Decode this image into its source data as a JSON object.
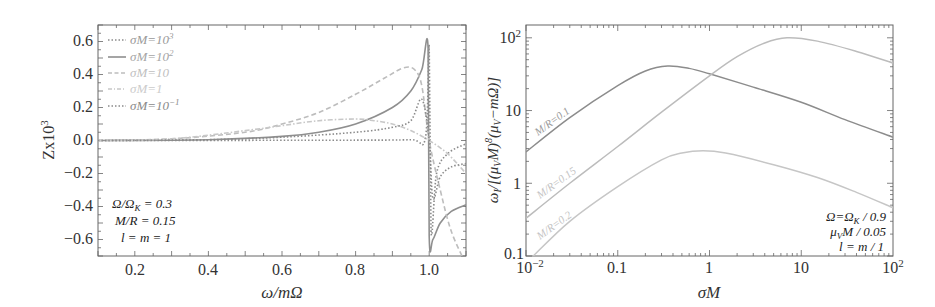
{
  "chart_data": [
    {
      "type": "line",
      "title": "",
      "xlabel": "ω/mΩ",
      "ylabel": "Zx10³",
      "xlim": [
        0.1,
        1.1
      ],
      "ylim": [
        -0.7,
        0.7
      ],
      "xticks": [
        "0.2",
        "0.4",
        "0.6",
        "0.8",
        "1.0"
      ],
      "yticks": [
        "0.6",
        "0.4",
        "0.2",
        "0.0",
        "-0.2",
        "-0.4",
        "-0.6"
      ],
      "grid": false,
      "legend_position": "upper-left",
      "legend": [
        "σM=10³",
        "σM=10²",
        "σM=10",
        "σM=1",
        "σM=10⁻¹"
      ],
      "annotations": [
        "Ω/Ω_K = 0.3",
        "M/R = 0.15",
        "l = m = 1"
      ],
      "series": [
        {
          "name": "σM=10³",
          "style": "dotted",
          "color": "#8a8a8a",
          "x": [
            0.1,
            0.5,
            0.8,
            0.95,
            0.99,
            1.0,
            1.005,
            1.02,
            1.05,
            1.1
          ],
          "y": [
            0.0,
            0.001,
            0.002,
            0.005,
            0.02,
            0.57,
            -0.55,
            -0.2,
            -0.08,
            -0.02
          ]
        },
        {
          "name": "σM=10²",
          "style": "solid",
          "color": "#8f8f8f",
          "x": [
            0.1,
            0.4,
            0.6,
            0.7,
            0.8,
            0.9,
            0.95,
            0.98,
            0.997,
            1.0,
            1.01,
            1.03,
            1.06,
            1.1
          ],
          "y": [
            0.0,
            0.005,
            0.025,
            0.05,
            0.1,
            0.2,
            0.3,
            0.43,
            0.56,
            -0.58,
            -0.6,
            -0.5,
            -0.43,
            -0.39
          ]
        },
        {
          "name": "σM=10",
          "style": "dashed",
          "color": "#bdbdbd",
          "x": [
            0.1,
            0.3,
            0.5,
            0.6,
            0.7,
            0.8,
            0.88,
            0.93,
            0.96,
            0.98,
            1.0,
            1.03,
            1.06,
            1.1
          ],
          "y": [
            0.0,
            0.01,
            0.05,
            0.1,
            0.17,
            0.28,
            0.38,
            0.44,
            0.43,
            0.33,
            0.0,
            -0.3,
            -0.55,
            -0.75
          ]
        },
        {
          "name": "σM=1",
          "style": "dash-dot",
          "color": "#c8c8c8",
          "x": [
            0.1,
            0.3,
            0.5,
            0.6,
            0.7,
            0.8,
            0.85,
            0.9,
            0.95,
            1.0,
            1.05,
            1.1
          ],
          "y": [
            0.0,
            0.01,
            0.06,
            0.09,
            0.12,
            0.13,
            0.12,
            0.1,
            0.06,
            0.0,
            -0.08,
            -0.2
          ]
        },
        {
          "name": "σM=10⁻¹",
          "style": "dotted",
          "color": "#8a8a8a",
          "x": [
            0.1,
            0.4,
            0.6,
            0.8,
            0.9,
            0.95,
            0.98,
            1.0,
            1.01,
            1.03,
            1.06,
            1.1
          ],
          "y": [
            0.0,
            0.005,
            0.02,
            0.05,
            0.08,
            0.12,
            0.25,
            0.0,
            -0.35,
            -0.22,
            -0.16,
            -0.14
          ]
        }
      ]
    },
    {
      "type": "line",
      "title": "",
      "xlabel": "σM",
      "ylabel": "ω_I/[(μ_V M)⁸(μ_V − mΩ)]",
      "xscale": "log",
      "yscale": "log",
      "xlim": [
        0.01,
        100
      ],
      "ylim": [
        0.1,
        150
      ],
      "xticks": [
        "10⁻²",
        "0.1",
        "1",
        "10",
        "10²"
      ],
      "yticks": [
        "10²",
        "10",
        "1",
        "0.1"
      ],
      "grid": false,
      "annotations": [
        "Ω=Ω_K / 0.9",
        "μ_V M / 0.05",
        "l = m / 1"
      ],
      "series": [
        {
          "name": "M/R=0.1",
          "color": "#8c8c8c",
          "x": [
            0.01,
            0.03,
            0.1,
            0.2,
            0.35,
            0.6,
            1,
            3,
            10,
            30,
            100
          ],
          "y": [
            2.7,
            8,
            22,
            35,
            41,
            38,
            32,
            21,
            13,
            7.5,
            4.3
          ]
        },
        {
          "name": "M/R=0.15",
          "color": "#bcbcbc",
          "x": [
            0.01,
            0.03,
            0.1,
            0.3,
            1,
            2,
            4,
            7,
            15,
            40,
            100
          ],
          "y": [
            0.33,
            1.0,
            3.2,
            9.5,
            30,
            55,
            85,
            100,
            90,
            65,
            45
          ]
        },
        {
          "name": "M/R=0.2",
          "color": "#c6c6c6",
          "x": [
            0.012,
            0.03,
            0.1,
            0.3,
            0.5,
            0.85,
            1.5,
            5,
            15,
            40,
            100
          ],
          "y": [
            0.1,
            0.3,
            0.9,
            2.1,
            2.6,
            2.8,
            2.6,
            1.8,
            1.2,
            0.75,
            0.46
          ]
        }
      ]
    }
  ],
  "left": {
    "ylabel": "Zx10",
    "ylabel_sup": "3",
    "xlabel": "ω/mΩ",
    "xticks": [
      "0.2",
      "0.4",
      "0.6",
      "0.8",
      "1.0"
    ],
    "yticks": [
      "0.6",
      "0.4",
      "0.2",
      "0.0",
      "−0.2",
      "−0.4",
      "−0.6"
    ],
    "legend": [
      {
        "label": "σM=10",
        "sup": "3"
      },
      {
        "label": "σM=10",
        "sup": "2"
      },
      {
        "label": "σM=10",
        "sup": ""
      },
      {
        "label": "σM=1",
        "sup": ""
      },
      {
        "label": "σM=10",
        "sup": "−1"
      }
    ],
    "annotations": [
      "Ω/Ω",
      "K",
      " = 0.3",
      "M/R = 0.15",
      "l = m = 1"
    ]
  },
  "right": {
    "ylabel": "ω",
    "ylabel_sub": "I",
    "ylabel_rest": "/[(μ",
    "ylabel_sub2": "V",
    "ylabel_rest2": "M)",
    "ylabel_sup": "8",
    "ylabel_rest3": "(μ",
    "ylabel_sub3": "V",
    "ylabel_rest4": "−mΩ)]",
    "xlabel": "σM",
    "xticks": [
      {
        "base": "10",
        "sup": "−2"
      },
      {
        "base": "0.1",
        "sup": ""
      },
      {
        "base": "1",
        "sup": ""
      },
      {
        "base": "10",
        "sup": ""
      },
      {
        "base": "10",
        "sup": "2"
      }
    ],
    "yticks": [
      {
        "base": "10",
        "sup": "2"
      },
      {
        "base": "10",
        "sup": ""
      },
      {
        "base": "1",
        "sup": ""
      },
      {
        "base": "0.1",
        "sup": ""
      }
    ],
    "curve_labels": [
      "M/R=0.1",
      "M/R=0.15",
      "M/R=0.2"
    ],
    "annotations": {
      "line1a": "Ω=Ω",
      "line1sub": "K",
      "line1b": " /  0.9",
      "line2a": "μ",
      "line2sub": "V",
      "line2b": "M /  0.05",
      "line3": "l = m /  1"
    }
  }
}
